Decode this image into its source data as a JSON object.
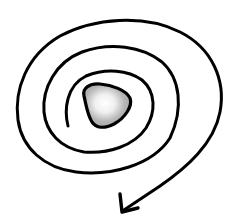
{
  "illustration": {
    "subject": "hand-drawn spiral with arrow",
    "stroke_color": "#000000",
    "core_fill": "#b8b8b8",
    "core_highlight": "#ffffff",
    "background": "#ffffff"
  }
}
